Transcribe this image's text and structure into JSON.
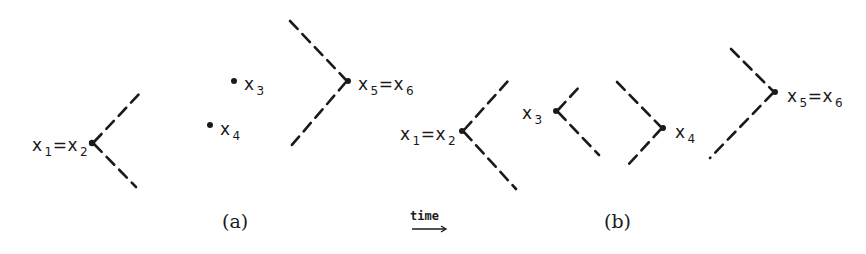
{
  "figure": {
    "panel_a": {
      "caption": "(a)",
      "points": [
        {
          "id": "x1x2",
          "label_main": "x",
          "label_sub1": "1",
          "label_eq": "=x",
          "label_sub2": "2",
          "x": 92,
          "y": 143
        },
        {
          "id": "x3",
          "label_main": "x",
          "label_sub": "3",
          "x": 234,
          "y": 81
        },
        {
          "id": "x4",
          "label_main": "x",
          "label_sub": "4",
          "x": 210,
          "y": 125
        },
        {
          "id": "x5x6",
          "label_main": "x",
          "label_sub1": "5",
          "label_eq": "=x",
          "label_sub2": "6",
          "x": 348,
          "y": 81
        }
      ]
    },
    "time_arrow": {
      "label": "time"
    },
    "panel_b": {
      "caption": "(b)",
      "points": [
        {
          "id": "x1x2",
          "label_main": "x",
          "label_sub1": "1",
          "label_eq": "=x",
          "label_sub2": "2",
          "x": 462,
          "y": 131
        },
        {
          "id": "x3",
          "label_main": "x",
          "label_sub": "3",
          "x": 556,
          "y": 111
        },
        {
          "id": "x4",
          "label_main": "x",
          "label_sub": "4",
          "x": 663,
          "y": 128
        },
        {
          "id": "x5x6",
          "label_main": "x",
          "label_sub1": "5",
          "label_eq": "=x",
          "label_sub2": "6",
          "x": 775,
          "y": 92
        }
      ]
    },
    "colors": {
      "ink": "#1a1a1a",
      "background": "#ffffff"
    }
  }
}
